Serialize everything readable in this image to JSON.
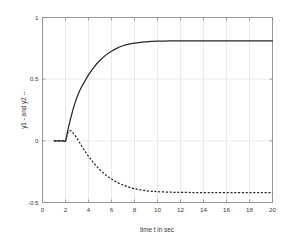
{
  "chart_data": {
    "type": "line",
    "title": "",
    "xlabel": "time t in sec",
    "ylabel": "y1 - and y2 --",
    "xlim": [
      0,
      20
    ],
    "ylim": [
      -0.5,
      1
    ],
    "xticks": [
      0,
      2,
      4,
      6,
      8,
      10,
      12,
      14,
      16,
      18,
      20
    ],
    "xtick_labels": [
      "0",
      "2",
      "4",
      "6",
      "8",
      "10",
      "12",
      "14",
      "16",
      "18",
      "20"
    ],
    "yticks": [
      -0.5,
      0,
      0.5,
      1
    ],
    "ytick_labels": [
      "-0.5",
      "0",
      "0.5",
      "1"
    ],
    "grid": true,
    "legend": "none",
    "background_color": "#ffffff",
    "axis_color": "#8d8d8d",
    "grid_color": "#e2e2e2",
    "line_color": "#262626",
    "series": [
      {
        "name": "y1",
        "style": "solid",
        "x": [
          1.0,
          1.4,
          1.8,
          2.0,
          2.2,
          2.5,
          2.8,
          3.2,
          3.6,
          4.0,
          4.5,
          5.0,
          5.5,
          6.0,
          6.5,
          7.0,
          7.5,
          8.0,
          8.5,
          9.0,
          9.5,
          10.0,
          11.0,
          12.0,
          13.0,
          14.0,
          15.0,
          16.0,
          17.0,
          18.0,
          19.0,
          20.0
        ],
        "values": [
          0.0,
          0.0,
          0.0,
          0.0,
          0.085,
          0.2,
          0.3,
          0.4,
          0.47,
          0.535,
          0.6,
          0.653,
          0.695,
          0.727,
          0.752,
          0.771,
          0.784,
          0.793,
          0.799,
          0.803,
          0.806,
          0.808,
          0.81,
          0.811,
          0.811,
          0.811,
          0.811,
          0.811,
          0.811,
          0.811,
          0.811,
          0.811
        ]
      },
      {
        "name": "y2",
        "style": "dashed",
        "x": [
          1.0,
          1.4,
          1.8,
          2.0,
          2.2,
          2.4,
          2.6,
          2.9,
          3.2,
          3.6,
          4.0,
          4.5,
          5.0,
          5.5,
          6.0,
          6.5,
          7.0,
          7.5,
          8.0,
          8.5,
          9.0,
          9.5,
          10.0,
          11.0,
          12.0,
          13.0,
          14.0,
          15.0,
          16.0,
          17.0,
          18.0,
          19.0,
          20.0
        ],
        "values": [
          0.0,
          0.0,
          0.0,
          0.0,
          0.065,
          0.082,
          0.07,
          0.035,
          -0.01,
          -0.07,
          -0.125,
          -0.185,
          -0.235,
          -0.277,
          -0.31,
          -0.337,
          -0.358,
          -0.375,
          -0.388,
          -0.397,
          -0.404,
          -0.409,
          -0.412,
          -0.416,
          -0.418,
          -0.419,
          -0.419,
          -0.419,
          -0.419,
          -0.419,
          -0.419,
          -0.419,
          -0.419
        ]
      }
    ]
  }
}
